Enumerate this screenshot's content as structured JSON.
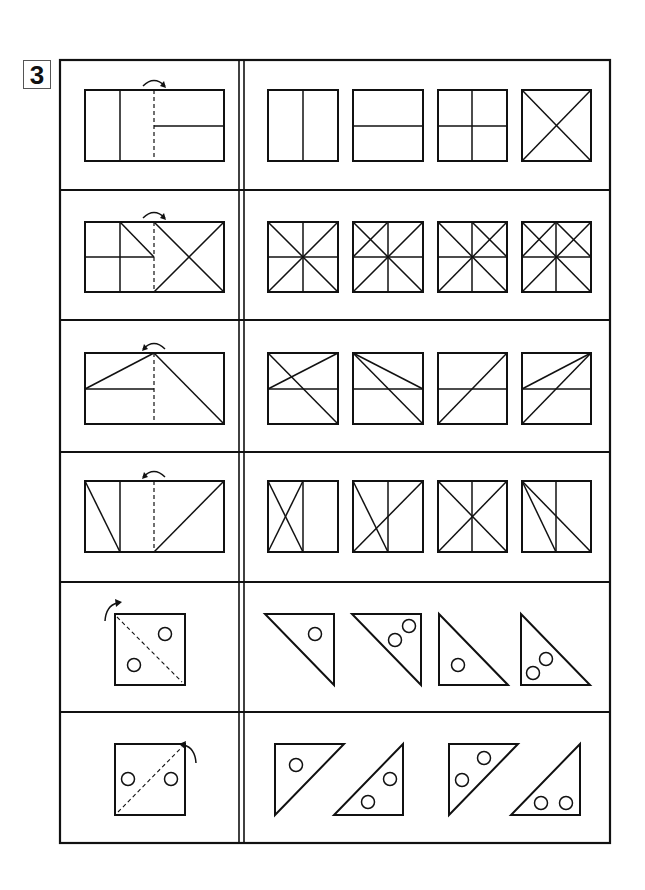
{
  "problem": {
    "number_label": "3",
    "instructions_visible": false
  },
  "table": {
    "x": 60,
    "y": 60,
    "width": 550,
    "height": 783,
    "divider_x": [
      239,
      244
    ],
    "row_bounds": [
      60,
      190,
      320,
      452,
      582,
      712,
      843
    ],
    "stroke_color": "#111111"
  },
  "rows": [
    {
      "id": "row-1",
      "question": {
        "kind": "rect",
        "box": [
          85,
          90,
          224,
          161
        ],
        "fold_line": {
          "x": 154,
          "dashed": true
        },
        "arrow": {
          "direction": "right",
          "cx": 154,
          "cy": 90
        },
        "lines": [
          [
            120,
            90,
            120,
            161
          ],
          [
            154,
            126,
            224,
            126
          ]
        ]
      },
      "options": [
        {
          "box": [
            268,
            90,
            338,
            161
          ],
          "lines": [
            [
              303,
              90,
              303,
              161
            ]
          ]
        },
        {
          "box": [
            353,
            90,
            423,
            161
          ],
          "lines": [
            [
              353,
              126,
              423,
              126
            ]
          ]
        },
        {
          "box": [
            438,
            90,
            507,
            161
          ],
          "lines": [
            [
              472,
              90,
              472,
              161
            ],
            [
              438,
              126,
              507,
              126
            ]
          ]
        },
        {
          "box": [
            522,
            90,
            591,
            161
          ],
          "lines": [
            [
              522,
              90,
              591,
              161
            ],
            [
              591,
              90,
              522,
              161
            ]
          ]
        }
      ]
    },
    {
      "id": "row-2",
      "question": {
        "kind": "rect",
        "box": [
          85,
          222,
          224,
          292
        ],
        "fold_line": {
          "x": 154,
          "dashed": true
        },
        "arrow": {
          "direction": "right",
          "cx": 154,
          "cy": 222
        },
        "lines": [
          [
            120,
            222,
            120,
            292
          ],
          [
            85,
            257,
            154,
            257
          ],
          [
            120,
            222,
            154,
            257
          ],
          [
            154,
            222,
            224,
            292
          ],
          [
            224,
            222,
            154,
            292
          ]
        ]
      },
      "options": [
        {
          "box": [
            268,
            222,
            338,
            292
          ],
          "lines": [
            [
              303,
              222,
              303,
              292
            ],
            [
              268,
              257,
              338,
              257
            ],
            [
              268,
              222,
              338,
              292
            ],
            [
              338,
              222,
              268,
              292
            ]
          ]
        },
        {
          "box": [
            353,
            222,
            423,
            292
          ],
          "lines": [
            [
              388,
              222,
              388,
              292
            ],
            [
              353,
              257,
              423,
              257
            ],
            [
              353,
              222,
              423,
              292
            ],
            [
              423,
              222,
              353,
              292
            ],
            [
              353,
              257,
              388,
              222
            ]
          ]
        },
        {
          "box": [
            438,
            222,
            507,
            292
          ],
          "lines": [
            [
              472,
              222,
              472,
              292
            ],
            [
              438,
              257,
              507,
              257
            ],
            [
              438,
              222,
              507,
              292
            ],
            [
              507,
              222,
              438,
              292
            ],
            [
              472,
              222,
              507,
              257
            ]
          ]
        },
        {
          "box": [
            522,
            222,
            591,
            292
          ],
          "lines": [
            [
              556,
              222,
              556,
              292
            ],
            [
              522,
              257,
              591,
              257
            ],
            [
              522,
              222,
              591,
              292
            ],
            [
              591,
              222,
              522,
              292
            ],
            [
              522,
              257,
              556,
              222
            ],
            [
              556,
              222,
              591,
              257
            ]
          ]
        }
      ]
    },
    {
      "id": "row-3",
      "question": {
        "kind": "rect",
        "box": [
          85,
          353,
          224,
          424
        ],
        "fold_line": {
          "x": 154,
          "dashed": true
        },
        "arrow": {
          "direction": "left",
          "cx": 154,
          "cy": 353
        },
        "lines": [
          [
            85,
            389,
            154,
            353
          ],
          [
            85,
            389,
            154,
            389
          ],
          [
            154,
            353,
            224,
            424
          ]
        ]
      },
      "options": [
        {
          "box": [
            268,
            353,
            338,
            424
          ],
          "lines": [
            [
              268,
              389,
              338,
              389
            ],
            [
              268,
              389,
              338,
              353
            ],
            [
              268,
              353,
              338,
              424
            ]
          ]
        },
        {
          "box": [
            353,
            353,
            423,
            424
          ],
          "lines": [
            [
              353,
              389,
              423,
              389
            ],
            [
              353,
              353,
              423,
              389
            ],
            [
              353,
              353,
              423,
              424
            ]
          ]
        },
        {
          "box": [
            438,
            353,
            507,
            424
          ],
          "lines": [
            [
              438,
              389,
              507,
              389
            ],
            [
              438,
              424,
              507,
              353
            ]
          ]
        },
        {
          "box": [
            522,
            353,
            591,
            424
          ],
          "lines": [
            [
              522,
              389,
              591,
              389
            ],
            [
              522,
              389,
              591,
              353
            ],
            [
              522,
              424,
              591,
              353
            ]
          ]
        }
      ]
    },
    {
      "id": "row-4",
      "question": {
        "kind": "rect",
        "box": [
          85,
          481,
          224,
          552
        ],
        "fold_line": {
          "x": 154,
          "dashed": true
        },
        "arrow": {
          "direction": "left",
          "cx": 154,
          "cy": 481
        },
        "lines": [
          [
            120,
            481,
            120,
            552
          ],
          [
            85,
            481,
            120,
            552
          ],
          [
            154,
            552,
            224,
            481
          ]
        ]
      },
      "options": [
        {
          "box": [
            268,
            481,
            338,
            552
          ],
          "lines": [
            [
              303,
              481,
              303,
              552
            ],
            [
              268,
              481,
              303,
              552
            ],
            [
              303,
              481,
              268,
              552
            ]
          ]
        },
        {
          "box": [
            353,
            481,
            423,
            552
          ],
          "lines": [
            [
              388,
              481,
              388,
              552
            ],
            [
              353,
              481,
              388,
              552
            ],
            [
              353,
              552,
              423,
              481
            ]
          ]
        },
        {
          "box": [
            438,
            481,
            507,
            552
          ],
          "lines": [
            [
              472,
              481,
              472,
              552
            ],
            [
              438,
              481,
              507,
              552
            ],
            [
              507,
              481,
              438,
              552
            ]
          ]
        },
        {
          "box": [
            522,
            481,
            591,
            552
          ],
          "lines": [
            [
              556,
              481,
              556,
              552
            ],
            [
              522,
              481,
              556,
              552
            ],
            [
              522,
              481,
              591,
              552
            ]
          ]
        }
      ]
    },
    {
      "id": "row-5",
      "question": {
        "kind": "square",
        "box": [
          115,
          614,
          185,
          685
        ],
        "fold_diagonal": [
          117,
          617,
          182,
          682
        ],
        "arrow": {
          "direction": "curve-up-right",
          "x": 105,
          "y": 600
        },
        "circles": [
          [
            165,
            634
          ],
          [
            134,
            665
          ]
        ]
      },
      "options": [
        {
          "triangle": [
            [
              265,
              614
            ],
            [
              334,
              614
            ],
            [
              334,
              685
            ]
          ],
          "circles": [
            [
              315,
              634
            ]
          ]
        },
        {
          "triangle": [
            [
              352,
              614
            ],
            [
              421,
              614
            ],
            [
              421,
              685
            ]
          ],
          "circles": [
            [
              409,
              626
            ],
            [
              395,
              640
            ]
          ]
        },
        {
          "triangle": [
            [
              439,
              614
            ],
            [
              439,
              685
            ],
            [
              508,
              685
            ]
          ],
          "circles": [
            [
              458,
              665
            ]
          ]
        },
        {
          "triangle": [
            [
              521,
              614
            ],
            [
              521,
              685
            ],
            [
              590,
              685
            ]
          ],
          "circles": [
            [
              546,
              659
            ],
            [
              533,
              673
            ]
          ]
        }
      ]
    },
    {
      "id": "row-6",
      "question": {
        "kind": "square",
        "box": [
          115,
          744,
          185,
          815
        ],
        "fold_diagonal": [
          118,
          812,
          182,
          747
        ],
        "arrow": {
          "direction": "curve-up-left",
          "x": 196,
          "y": 752
        },
        "circles": [
          [
            128,
            779
          ],
          [
            171,
            779
          ]
        ]
      },
      "options": [
        {
          "triangle": [
            [
              275,
              744
            ],
            [
              344,
              744
            ],
            [
              275,
              815
            ]
          ],
          "circles": [
            [
              296,
              765
            ]
          ]
        },
        {
          "triangle": [
            [
              403,
              744
            ],
            [
              403,
              815
            ],
            [
              334,
              815
            ]
          ],
          "circles": [
            [
              390,
              779
            ],
            [
              368,
              802
            ]
          ]
        },
        {
          "triangle": [
            [
              449,
              744
            ],
            [
              518,
              744
            ],
            [
              449,
              815
            ]
          ],
          "circles": [
            [
              484,
              758
            ],
            [
              462,
              780
            ]
          ]
        },
        {
          "triangle": [
            [
              580,
              744
            ],
            [
              580,
              815
            ],
            [
              511,
              815
            ]
          ],
          "circles": [
            [
              541,
              803
            ],
            [
              566,
              803
            ]
          ]
        }
      ]
    }
  ]
}
